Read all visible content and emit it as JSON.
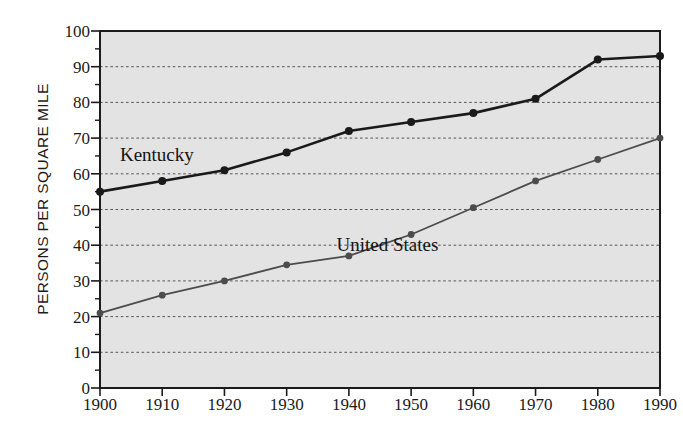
{
  "chart_data": {
    "type": "line",
    "title": "",
    "xlabel": "",
    "ylabel": "PERSONS PER SQUARE MILE",
    "categories": [
      "1900",
      "1910",
      "1920",
      "1930",
      "1940",
      "1950",
      "1960",
      "1970",
      "1980",
      "1990"
    ],
    "x": [
      1900,
      1910,
      1920,
      1930,
      1940,
      1950,
      1960,
      1970,
      1980,
      1990
    ],
    "xlim": [
      1900,
      1990
    ],
    "ylim": [
      0,
      100
    ],
    "y_ticks": [
      0,
      10,
      20,
      30,
      40,
      50,
      60,
      70,
      80,
      90,
      100
    ],
    "y_tick_labels": [
      "0",
      "10",
      "20",
      "30",
      "40",
      "50",
      "60",
      "70",
      "80",
      "90",
      "100"
    ],
    "y_minor_tick_interval": 5,
    "grid": true,
    "grid_style": "dotted-horizontal",
    "legend": "inline-labels",
    "series": [
      {
        "name": "Kentucky",
        "color": "#1a1a1a",
        "line_width": 2.6,
        "marker": "circle",
        "values": [
          55,
          58,
          61,
          66,
          72,
          74.5,
          77,
          81,
          92,
          93
        ]
      },
      {
        "name": "United States",
        "color": "#4c4c4c",
        "line_width": 1.8,
        "marker": "circle",
        "values": [
          21,
          26,
          30,
          34.5,
          37,
          43,
          50.5,
          58,
          64,
          70
        ]
      }
    ],
    "annotations": [
      {
        "text": "Kentucky",
        "x": 1903.2,
        "y": 63.5,
        "font_size": 19
      },
      {
        "text": "United  States",
        "x": 1938.0,
        "y": 38.5,
        "font_size": 19
      }
    ]
  },
  "style": {
    "plot_background": "#e3e3e3",
    "page_background": "#ffffff",
    "axis_color": "#1b1b1b",
    "gridline_color": "#555555"
  },
  "axes_tick_labels": {
    "y": [
      "100",
      "90",
      "80",
      "70",
      "60",
      "50",
      "40",
      "30",
      "20",
      "10",
      "0"
    ],
    "x": [
      "1900",
      "1910",
      "1920",
      "1930",
      "1940",
      "1950",
      "1960",
      "1970",
      "1980",
      "1990"
    ]
  }
}
